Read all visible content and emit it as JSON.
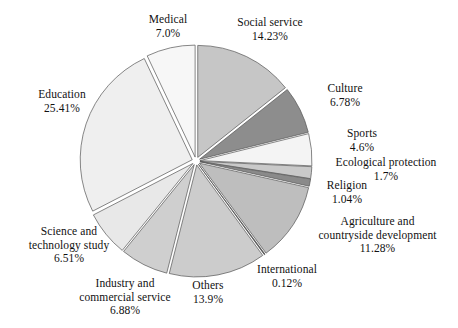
{
  "chart_data": {
    "type": "pie",
    "title": "",
    "subtitle": "",
    "xlabel": "",
    "ylabel": "",
    "legend_position": "none",
    "grid": false,
    "label_format": "name above percentage",
    "exploded": true,
    "start_angle_deg": 0,
    "direction": "clockwise",
    "categories": [
      "Social service",
      "Culture",
      "Sports",
      "Ecological protection",
      "Religion",
      "Agriculture and countryside development",
      "International",
      "Others",
      "Industry and commercial service",
      "Science and technology study",
      "Education",
      "Medical"
    ],
    "values": [
      14.23,
      6.78,
      4.6,
      1.7,
      1.04,
      11.28,
      0.12,
      13.9,
      6.88,
      6.51,
      25.41,
      7.0
    ],
    "slices": [
      {
        "name": "Social service",
        "label_line1": "Social service",
        "label_line2": "14.23%",
        "value": 14.23,
        "color": "#c6c6c6"
      },
      {
        "name": "Culture",
        "label_line1": "Culture",
        "label_line2": "6.78%",
        "value": 6.78,
        "color": "#8d8d8d"
      },
      {
        "name": "Sports",
        "label_line1": "Sports",
        "label_line2": "4.6%",
        "value": 4.6,
        "color": "#f4f4f4"
      },
      {
        "name": "Ecological protection",
        "label_line1": "Ecological protection",
        "label_line2": "1.7%",
        "value": 1.7,
        "color": "#c9c9c9"
      },
      {
        "name": "Religion",
        "label_line1": "Religion",
        "label_line2": "1.04%",
        "value": 1.04,
        "color": "#8a8a8a"
      },
      {
        "name": "Agriculture and countryside development",
        "label_line1": "Agriculture and",
        "label_line2": "countryside development",
        "label_line3": "11.28%",
        "value": 11.28,
        "color": "#bebebe"
      },
      {
        "name": "International",
        "label_line1": "International",
        "label_line2": "0.12%",
        "value": 0.12,
        "color": "#3a3a3a"
      },
      {
        "name": "Others",
        "label_line1": "Others",
        "label_line2": "13.9%",
        "value": 13.9,
        "color": "#cccccc"
      },
      {
        "name": "Industry and commercial service",
        "label_line1": "Industry and",
        "label_line2": "commercial service",
        "label_line3": "6.88%",
        "value": 6.88,
        "color": "#cfcfcf"
      },
      {
        "name": "Science and technology study",
        "label_line1": "Science and",
        "label_line2": "technology study",
        "label_line3": "6.51%",
        "value": 6.51,
        "color": "#e8e8e8"
      },
      {
        "name": "Education",
        "label_line1": "Education",
        "label_line2": "25.41%",
        "value": 25.41,
        "color": "#efefef"
      },
      {
        "name": "Medical",
        "label_line1": "Medical",
        "label_line2": "7.0%",
        "value": 7.0,
        "color": "#f7f7f7"
      }
    ],
    "geometry": {
      "center_x": 196,
      "center_y": 161,
      "radius": 112,
      "explode_offset": 4,
      "stroke": "#555555",
      "background": "#ffffff"
    }
  }
}
